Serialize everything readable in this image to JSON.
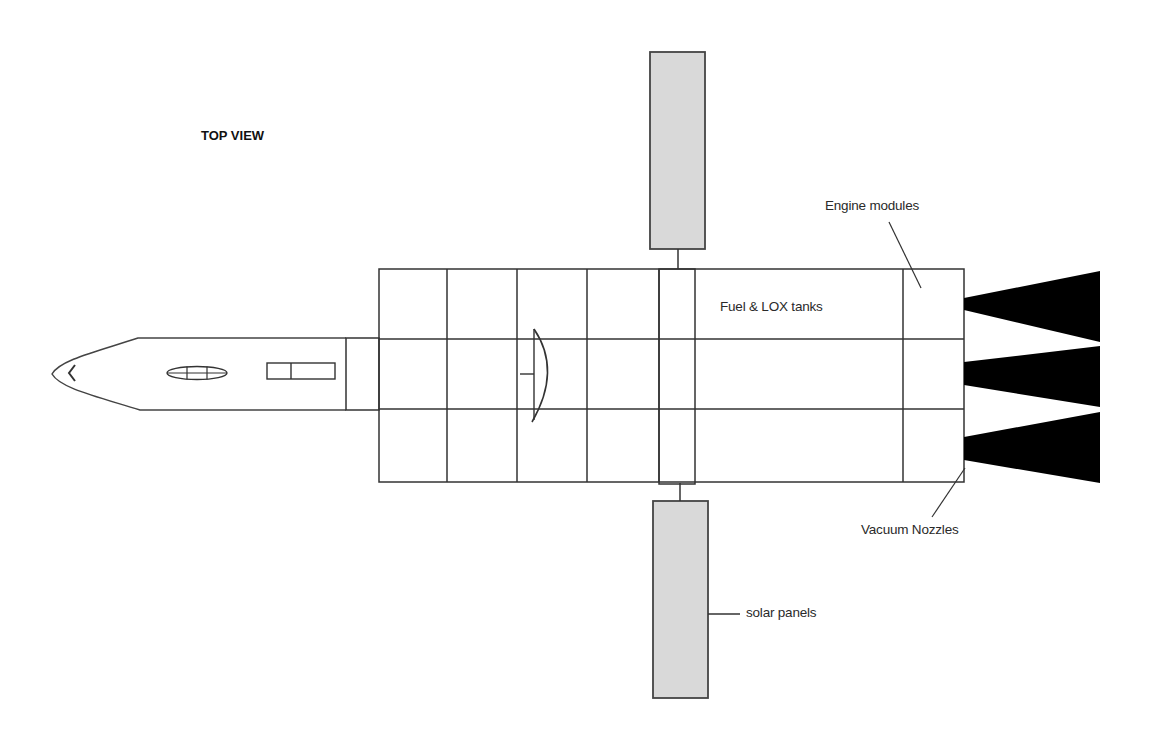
{
  "diagram": {
    "view_title": "TOP VIEW",
    "labels": {
      "engine_modules": "Engine modules",
      "fuel_lox_tanks": "Fuel & LOX tanks",
      "vacuum_nozzles": "Vacuum Nozzles",
      "solar_panels": "solar panels"
    },
    "components": [
      {
        "id": "nose-capsule",
        "name": "Crew / nose section"
      },
      {
        "id": "tank-grid",
        "name": "Fuel & LOX tanks",
        "rows": 3,
        "columns": 6
      },
      {
        "id": "engine-modules",
        "name": "Engine modules",
        "count": 3
      },
      {
        "id": "vacuum-nozzles",
        "name": "Vacuum Nozzles",
        "count": 3
      },
      {
        "id": "solar-panels",
        "name": "solar panels",
        "count": 2
      }
    ],
    "colors": {
      "line": "#333333",
      "panel_fill": "#d9d9d9",
      "nozzle_fill": "#000000",
      "background": "#ffffff"
    }
  }
}
